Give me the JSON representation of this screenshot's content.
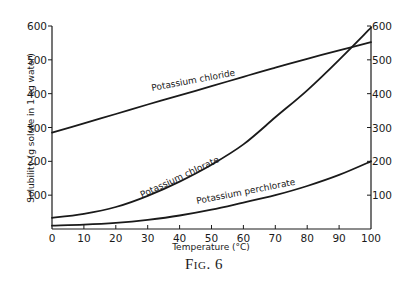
{
  "chart_data": {
    "type": "line",
    "title": "",
    "caption": "Fig. 6",
    "xlabel": "Temperature (°C)",
    "ylabel": "Solubility (g solute in 1 kg water)",
    "xlim": [
      0,
      100
    ],
    "ylim": [
      0,
      600
    ],
    "x_ticks": [
      0,
      10,
      20,
      30,
      40,
      50,
      60,
      70,
      80,
      90,
      100
    ],
    "y_ticks_left": [
      100,
      200,
      300,
      400,
      500,
      600
    ],
    "y_ticks_right": [
      100,
      200,
      300,
      400,
      500,
      600
    ],
    "grid": false,
    "legend": "inline labels on curves",
    "x": [
      0,
      10,
      20,
      30,
      40,
      50,
      60,
      70,
      80,
      90,
      100
    ],
    "series": [
      {
        "name": "Potassium chloride",
        "values": [
          285,
          312,
          340,
          368,
          395,
          422,
          450,
          477,
          503,
          528,
          552
        ]
      },
      {
        "name": "Potassium chlorate",
        "values": [
          33,
          45,
          65,
          98,
          140,
          190,
          250,
          330,
          410,
          500,
          595
        ]
      },
      {
        "name": "Potassium perchlorate",
        "values": [
          10,
          13,
          18,
          27,
          40,
          57,
          78,
          100,
          127,
          160,
          200
        ]
      }
    ]
  },
  "labels": {
    "ylabel": "Solubility (g solute in 1 kg water)",
    "xlabel": "Temperature (°C)",
    "caption": "Fig. 6",
    "chloride": "Potassium chloride",
    "chlorate": "Potassium chlorate",
    "perchlorate": "Potassium perchlorate",
    "zero": "0"
  }
}
